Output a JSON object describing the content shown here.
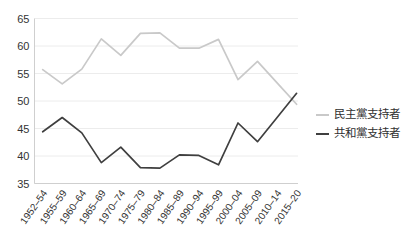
{
  "chart_data": {
    "type": "line",
    "title": "",
    "xlabel": "",
    "ylabel": "",
    "categories": [
      "1952–54",
      "1955–59",
      "1960–64",
      "1965–69",
      "1970–74",
      "1975–79",
      "1980–84",
      "1985–89",
      "1990–94",
      "1995–99",
      "2000–04",
      "2005–09",
      "2010–14",
      "2015–20"
    ],
    "series": [
      {
        "name": "民主黨支持者",
        "color": "#c9c9c9",
        "values": [
          55.7,
          53.1,
          55.8,
          61.3,
          58.3,
          62.3,
          62.4,
          59.6,
          59.6,
          61.2,
          53.9,
          57.2,
          53.3,
          49.4
        ]
      },
      {
        "name": "共和黨支持者",
        "color": "#3f3f3f",
        "values": [
          44.4,
          47.0,
          44.2,
          38.8,
          41.6,
          37.9,
          37.8,
          40.2,
          40.1,
          38.4,
          46.0,
          42.6,
          47.0,
          51.4
        ]
      }
    ],
    "ylim": [
      35,
      65
    ],
    "yticks": [
      35,
      40,
      45,
      50,
      55,
      60,
      65
    ],
    "grid": true,
    "legend_position": "right",
    "x_label_rotation_deg": -55
  },
  "style": {
    "grid_color": "#ececec",
    "axis_color": "#cfcfcf",
    "tick_text_color": "#333333",
    "background": "#ffffff"
  }
}
